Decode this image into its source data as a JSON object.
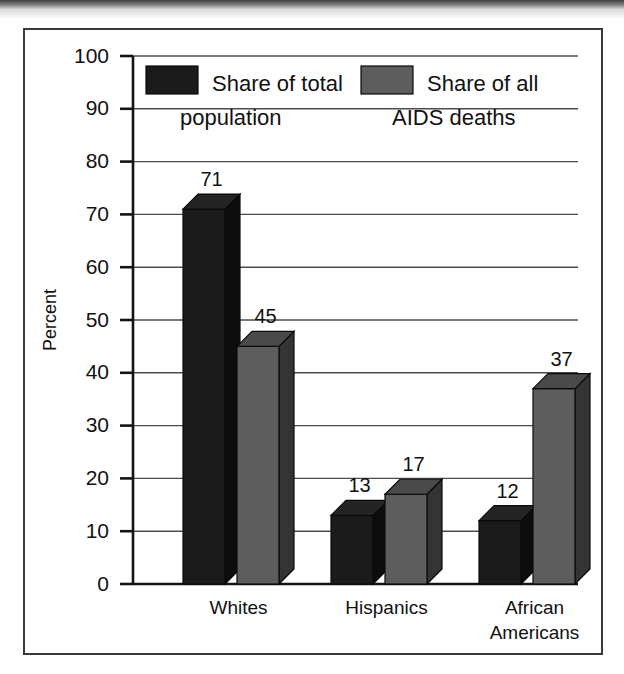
{
  "chart_data": {
    "type": "bar",
    "title": "",
    "xlabel": "",
    "ylabel": "Percent",
    "ylim": [
      0,
      100
    ],
    "ytick_step": 10,
    "yticks": [
      "0",
      "10",
      "20",
      "30",
      "40",
      "50",
      "60",
      "70",
      "80",
      "90",
      "100"
    ],
    "grid": true,
    "legend_position": "top-inside",
    "style_3d": true,
    "categories": [
      "Whites",
      "Hispanics",
      "African Americans"
    ],
    "category_label_lines": [
      [
        "Whites"
      ],
      [
        "Hispanics"
      ],
      [
        "African",
        "Americans"
      ]
    ],
    "series": [
      {
        "name": "Share of total population",
        "name_lines": [
          "Share of total",
          "population"
        ],
        "color": "#1b1b1b",
        "values": [
          71,
          13,
          12
        ],
        "value_labels": [
          "71",
          "13",
          "12"
        ]
      },
      {
        "name": "Share of all AIDS deaths",
        "name_lines": [
          "Share of all",
          "AIDS deaths"
        ],
        "color": "#5d5d5d",
        "values": [
          45,
          17,
          37
        ],
        "value_labels": [
          "45",
          "17",
          "37"
        ]
      }
    ]
  },
  "legend": {
    "entries": [
      {
        "swatch": "dark-swatch",
        "line1": "Share of total",
        "line2": "population"
      },
      {
        "swatch": "gray-swatch",
        "line1": "Share of all",
        "line2": "AIDS deaths"
      }
    ]
  },
  "axis": {
    "y_title": "Percent",
    "y_ticks": [
      "100",
      "90",
      "80",
      "70",
      "60",
      "50",
      "40",
      "30",
      "20",
      "10",
      "0"
    ],
    "x_labels": [
      "Whites",
      "Hispanics",
      "African",
      "Americans"
    ]
  },
  "colors": {
    "bar_dark_front": "#1b1b1b",
    "bar_dark_top": "#242424",
    "bar_dark_side": "#0d0d0d",
    "bar_gray_front": "#5d5d5d",
    "bar_gray_top": "#4a4a4a",
    "bar_gray_side": "#343434",
    "frame": "#3a3a3a",
    "grid": "#4c4c4c",
    "axis": "#141414",
    "text": "#111111",
    "page_background": "#ffffff"
  }
}
